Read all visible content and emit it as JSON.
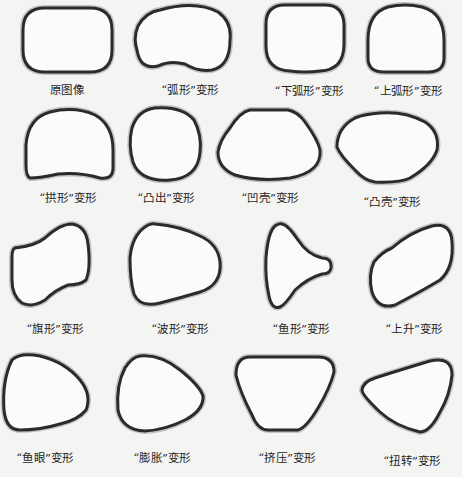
{
  "figure": {
    "items": [
      {
        "id": "original",
        "label": "原图像",
        "row": 1,
        "col": 1
      },
      {
        "id": "arc",
        "label": "“弧形”变形",
        "row": 1,
        "col": 2
      },
      {
        "id": "arc-lower",
        "label": "“下弧形”变形",
        "row": 1,
        "col": 3
      },
      {
        "id": "arc-upper",
        "label": "“上弧形”变形",
        "row": 1,
        "col": 4
      },
      {
        "id": "arch",
        "label": "“拱形”变形",
        "row": 2,
        "col": 1
      },
      {
        "id": "bulge",
        "label": "“凸出”变形",
        "row": 2,
        "col": 2
      },
      {
        "id": "shell-lower",
        "label": "“凹壳”变形",
        "row": 2,
        "col": 3
      },
      {
        "id": "shell-upper",
        "label": "“凸壳”变形",
        "row": 2,
        "col": 4
      },
      {
        "id": "flag",
        "label": "“旗形”变形",
        "row": 3,
        "col": 1
      },
      {
        "id": "wave",
        "label": "“波形”变形",
        "row": 3,
        "col": 2
      },
      {
        "id": "fish",
        "label": "“鱼形”变形",
        "row": 3,
        "col": 3
      },
      {
        "id": "rise",
        "label": "“上升”变形",
        "row": 3,
        "col": 4
      },
      {
        "id": "fisheye",
        "label": "“鱼眼”变形",
        "row": 4,
        "col": 1
      },
      {
        "id": "inflate",
        "label": "“膨胀”变形",
        "row": 4,
        "col": 2
      },
      {
        "id": "squeeze",
        "label": "“挤压”变形",
        "row": 4,
        "col": 3
      },
      {
        "id": "twist",
        "label": "“扭转”变形",
        "row": 4,
        "col": 4
      }
    ],
    "colors": {
      "background": "#f4f4f2",
      "outline": "#2b2b2b",
      "shadow": "#9a9a9a"
    }
  }
}
